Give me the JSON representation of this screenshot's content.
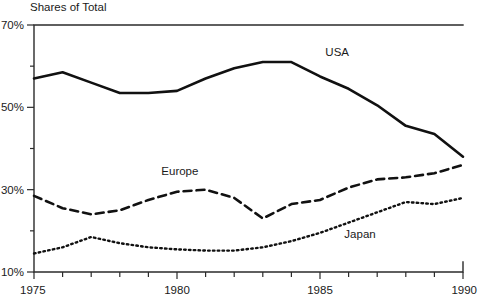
{
  "chart_data": {
    "type": "line",
    "title": "Shares of Total",
    "xlabel": "",
    "ylabel": "",
    "xlim": [
      1975,
      1990
    ],
    "ylim": [
      10,
      70
    ],
    "grid": false,
    "legend_position": "inline-annotations",
    "x": [
      1975,
      1976,
      1977,
      1978,
      1979,
      1980,
      1981,
      1982,
      1983,
      1984,
      1985,
      1986,
      1987,
      1988,
      1989,
      1990
    ],
    "xticks_major": [
      1975,
      1980,
      1985,
      1990
    ],
    "xtick_labels": [
      "1975",
      "1980",
      "1985",
      "1990"
    ],
    "xticks_minor": [
      1976,
      1977,
      1978,
      1979,
      1981,
      1982,
      1983,
      1984,
      1986,
      1987,
      1988,
      1989
    ],
    "yticks_major": [
      10,
      30,
      50,
      70
    ],
    "ytick_labels": [
      "10%",
      "30%",
      "50%",
      "70%"
    ],
    "yticks_minor": [
      20,
      40,
      60
    ],
    "series": [
      {
        "name": "USA",
        "style": "solid",
        "color": "#111111",
        "label_x": 1985.6,
        "label_y": 62.5,
        "values": [
          57.0,
          58.5,
          56.0,
          53.5,
          53.5,
          54.0,
          57.0,
          59.5,
          61.0,
          61.0,
          57.5,
          54.5,
          50.5,
          45.5,
          43.5,
          38.0
        ]
      },
      {
        "name": "Europe",
        "style": "dashed",
        "color": "#111111",
        "label_x": 1980.1,
        "label_y": 33.5,
        "values": [
          28.5,
          25.5,
          24.0,
          25.0,
          27.5,
          29.5,
          30.0,
          28.0,
          23.0,
          26.5,
          27.5,
          30.5,
          32.5,
          33.0,
          34.0,
          36.0
        ]
      },
      {
        "name": "Japan",
        "style": "dotted",
        "color": "#111111",
        "label_x": 1986.4,
        "label_y": 18.2,
        "values": [
          14.5,
          16.0,
          18.5,
          17.0,
          16.0,
          15.5,
          15.2,
          15.2,
          16.0,
          17.5,
          19.5,
          22.0,
          24.5,
          27.0,
          26.5,
          28.0
        ]
      }
    ]
  }
}
